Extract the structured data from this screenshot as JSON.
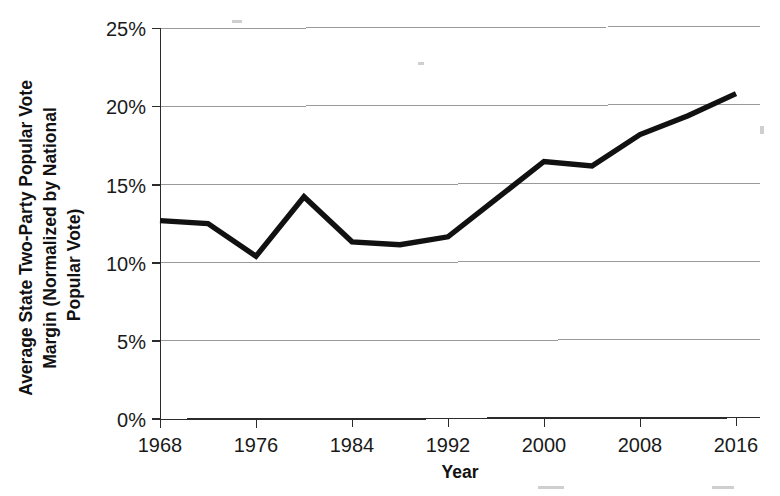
{
  "chart_data": {
    "type": "line",
    "title": "",
    "xlabel": "Year",
    "ylabel": "Average State Two-Party Popular Vote Margin (Normalized by National Popular Vote)",
    "ylabel_lines": [
      "Average State Two-Party Popular Vote",
      "Margin (Normalized by National",
      "Popular Vote)"
    ],
    "x": [
      1968,
      1972,
      1976,
      1980,
      1984,
      1988,
      1992,
      1996,
      2000,
      2004,
      2008,
      2012,
      2016
    ],
    "values": [
      12.7,
      12.5,
      10.4,
      14.2,
      11.3,
      11.1,
      11.6,
      14.0,
      16.4,
      16.1,
      18.1,
      19.3,
      20.7
    ],
    "xlim": [
      1968,
      2016
    ],
    "ylim": [
      0,
      25
    ],
    "xticks": [
      1968,
      1976,
      1984,
      1992,
      2000,
      2008,
      2016
    ],
    "xtick_labels": [
      "1968",
      "1976",
      "1984",
      "1992",
      "2000",
      "2008",
      "2016"
    ],
    "yticks": [
      0,
      5,
      10,
      15,
      20,
      25
    ],
    "ytick_labels": [
      "0%",
      "5%",
      "10%",
      "15%",
      "20%",
      "25%"
    ],
    "grid": "horizontal",
    "legend": "none",
    "series_color": "#111111",
    "grid_color": "#9a9a9a",
    "axis_color": "#2b2b2b",
    "background_color": "#ffffff"
  }
}
